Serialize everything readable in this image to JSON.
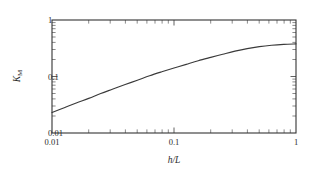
{
  "figure": {
    "background_color": "#ffffff",
    "frame_color": "#333333",
    "curve_color": "#3a3a3a"
  },
  "chart_data": {
    "type": "line",
    "title": "",
    "subtitle": "",
    "xlabel": "h/L",
    "ylabel": "K_M",
    "ylabel_base": "K",
    "ylabel_sub": "M",
    "xscale": "log",
    "yscale": "log",
    "xlim": [
      0.01,
      1
    ],
    "ylim": [
      0.01,
      1
    ],
    "grid": false,
    "legend": null,
    "legend_position": "none",
    "xticks": [
      0.01,
      0.1,
      1
    ],
    "xtick_labels": [
      "0.01",
      "0.1",
      "1"
    ],
    "yticks": [
      0.01,
      0.1,
      1
    ],
    "ytick_labels": [
      "0.01",
      "0.1",
      "1"
    ],
    "minor_ticks": true,
    "minor_tick_direction": "inward",
    "series": [
      {
        "name": "K_M",
        "x": [
          0.01,
          0.0126,
          0.0158,
          0.02,
          0.0251,
          0.0316,
          0.0398,
          0.0501,
          0.0631,
          0.0794,
          0.1,
          0.126,
          0.158,
          0.2,
          0.251,
          0.316,
          0.398,
          0.501,
          0.631,
          0.794,
          1.0
        ],
        "y": [
          0.023,
          0.028,
          0.034,
          0.041,
          0.05,
          0.06,
          0.072,
          0.086,
          0.103,
          0.121,
          0.141,
          0.164,
          0.19,
          0.218,
          0.248,
          0.281,
          0.312,
          0.338,
          0.357,
          0.37,
          0.378
        ]
      }
    ],
    "annotations": []
  },
  "xtick_labels": [
    {
      "text": "0.01"
    },
    {
      "text": "0.1"
    },
    {
      "text": "1"
    }
  ],
  "ytick_labels": [
    {
      "text": "1"
    },
    {
      "text": "0.1"
    },
    {
      "text": "0.01"
    }
  ]
}
